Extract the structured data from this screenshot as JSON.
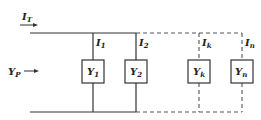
{
  "diagram": {
    "type": "parallel-admittance-circuit",
    "total_current": {
      "symbol": "I",
      "sub": "T"
    },
    "equivalent_admittance": {
      "symbol": "Y",
      "sub": "P"
    },
    "branches": [
      {
        "current": {
          "symbol": "I",
          "sub": "1"
        },
        "admittance": {
          "symbol": "Y",
          "sub": "1"
        },
        "style": "solid"
      },
      {
        "current": {
          "symbol": "I",
          "sub": "2"
        },
        "admittance": {
          "symbol": "Y",
          "sub": "2"
        },
        "style": "solid"
      },
      {
        "current": {
          "symbol": "I",
          "sub": "k"
        },
        "admittance": {
          "symbol": "Y",
          "sub": "k"
        },
        "style": "dashed"
      },
      {
        "current": {
          "symbol": "I",
          "sub": "n"
        },
        "admittance": {
          "symbol": "Y",
          "sub": "n"
        },
        "style": "dashed"
      }
    ],
    "colors": {
      "line": "#333333",
      "background": "#ffffff"
    }
  }
}
